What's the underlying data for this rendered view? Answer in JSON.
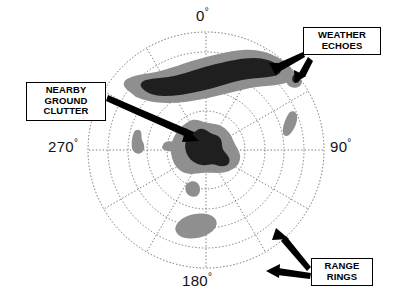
{
  "figure": {
    "type": "radar-ppi-display",
    "title": "",
    "background": "#ffffff"
  },
  "radar": {
    "center": {
      "x": 206,
      "y": 150
    },
    "outer_radius": 118,
    "ring_count": 6,
    "ring_radii": [
      20,
      39,
      59,
      78,
      98,
      118
    ],
    "spoke_count": 12,
    "spoke_step_degrees": 30,
    "grid_color": "#6d6d6d",
    "grid_style": "dotted",
    "echo_fill_outer": "#8f8f8f",
    "echo_fill_core": "#1f1f1f"
  },
  "axis_labels": [
    {
      "name": "bearing-0",
      "value": "0",
      "degree_symbol": "°",
      "angle": 0
    },
    {
      "name": "bearing-90",
      "value": "90",
      "degree_symbol": "°",
      "angle": 90
    },
    {
      "name": "bearing-180",
      "value": "180",
      "degree_symbol": "°",
      "angle": 180
    },
    {
      "name": "bearing-270",
      "value": "270",
      "degree_symbol": "°",
      "angle": 270
    }
  ],
  "callouts": [
    {
      "name": "weather-echoes",
      "label": "WEATHER\nECHOES",
      "lines": [
        "WEATHER",
        "ECHOES"
      ],
      "arrow_count": 2
    },
    {
      "name": "nearby-ground-clutter",
      "label": "NEARBY\nGROUND\nCLUTTER",
      "lines": [
        "NEARBY",
        "GROUND",
        "CLUTTER"
      ],
      "arrow_count": 1
    },
    {
      "name": "range-rings",
      "label": "RANGE\nRINGS",
      "lines": [
        "RANGE",
        "RINGS"
      ],
      "arrow_count": 2
    }
  ],
  "echoes": [
    {
      "name": "main-weather-echo",
      "description": "large elongated storm cell north of center"
    },
    {
      "name": "secondary-weather-echo",
      "description": "small echo northeast outer ring"
    },
    {
      "name": "ground-clutter-core",
      "description": "clutter blob at radar center"
    },
    {
      "name": "east-echo",
      "description": "elongated echo east-northeast"
    },
    {
      "name": "west-echo",
      "description": "small echo west of center"
    },
    {
      "name": "near-west-echo",
      "description": "tiny echo just west of clutter"
    },
    {
      "name": "south-near-echo",
      "description": "small echo south of clutter"
    },
    {
      "name": "south-echo",
      "description": "oval echo toward 180 degrees"
    }
  ]
}
